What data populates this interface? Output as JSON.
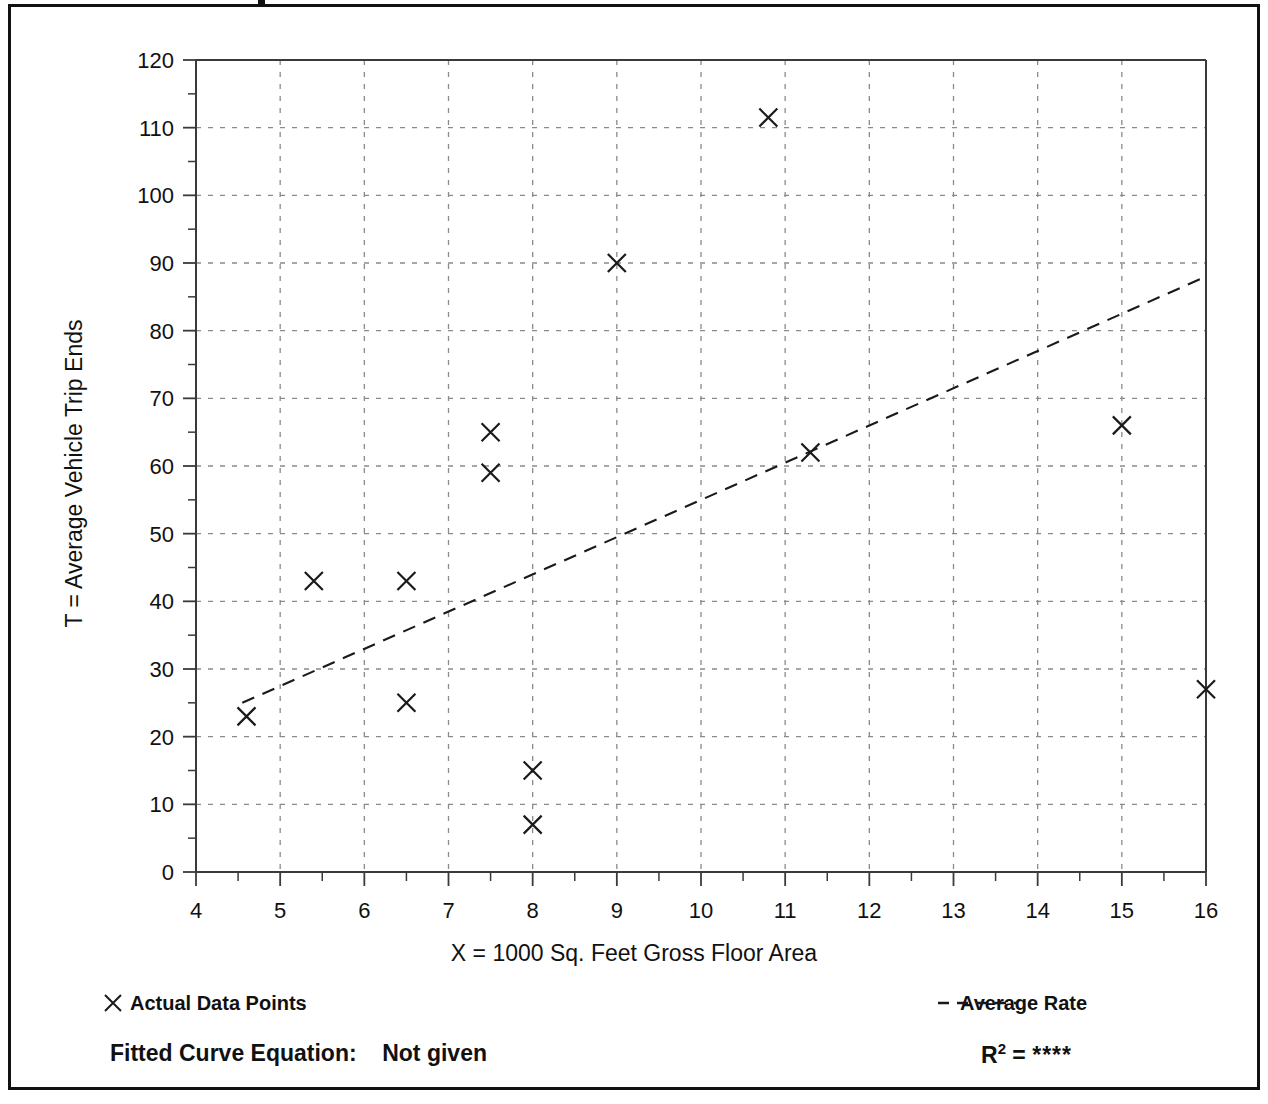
{
  "chart_data": {
    "type": "scatter",
    "title": "",
    "xlabel": "X = 1000 Sq. Feet Gross Floor Area",
    "ylabel": "T = Average Vehicle Trip Ends",
    "xlim": [
      4,
      16
    ],
    "ylim": [
      0,
      120
    ],
    "xticks": [
      4,
      5,
      6,
      7,
      8,
      9,
      10,
      11,
      12,
      13,
      14,
      15,
      16
    ],
    "yticks": [
      0,
      10,
      20,
      30,
      40,
      50,
      60,
      70,
      80,
      90,
      100,
      110,
      120
    ],
    "x_minor_tick_step": 0.5,
    "y_minor_tick_step": 5,
    "grid": true,
    "legend_position": "below-axis",
    "series": [
      {
        "name": "Actual Data Points",
        "marker": "x",
        "points": [
          {
            "x": 4.6,
            "y": 23
          },
          {
            "x": 5.4,
            "y": 43
          },
          {
            "x": 6.5,
            "y": 43
          },
          {
            "x": 6.5,
            "y": 25
          },
          {
            "x": 7.5,
            "y": 65
          },
          {
            "x": 7.5,
            "y": 59
          },
          {
            "x": 8.0,
            "y": 15
          },
          {
            "x": 8.0,
            "y": 7
          },
          {
            "x": 9.0,
            "y": 90
          },
          {
            "x": 10.8,
            "y": 111.5
          },
          {
            "x": 11.3,
            "y": 62
          },
          {
            "x": 15.0,
            "y": 66
          },
          {
            "x": 16.0,
            "y": 27
          }
        ]
      },
      {
        "name": "Average Rate",
        "style": "dashed-line",
        "points": [
          {
            "x": 4.55,
            "y": 25
          },
          {
            "x": 16.0,
            "y": 88
          }
        ]
      }
    ]
  },
  "axes": {
    "x_title": "X = 1000 Sq. Feet Gross Floor Area",
    "y_title": "T = Average Vehicle Trip Ends",
    "x_tick_labels": [
      "4",
      "5",
      "6",
      "7",
      "8",
      "9",
      "10",
      "11",
      "12",
      "13",
      "14",
      "15",
      "16"
    ],
    "y_tick_labels": [
      "0",
      "10",
      "20",
      "30",
      "40",
      "50",
      "60",
      "70",
      "80",
      "90",
      "100",
      "110",
      "120"
    ]
  },
  "legend": {
    "data_points_label": "Actual Data Points",
    "data_points_marker": "x-marker-icon",
    "average_rate_label": "Average Rate",
    "average_rate_marker": "dashed-line-icon"
  },
  "annotations": {
    "fitted_curve_label": "Fitted Curve Equation:",
    "fitted_curve_value": "Not given",
    "r_squared_label": "R",
    "r_squared_exponent": "2",
    "r_squared_equals": "=",
    "r_squared_value": "****"
  },
  "colors": {
    "ink": "#111111",
    "grid": "#8a8a8a",
    "axis": "#3a3a3a",
    "background": "#ffffff"
  }
}
